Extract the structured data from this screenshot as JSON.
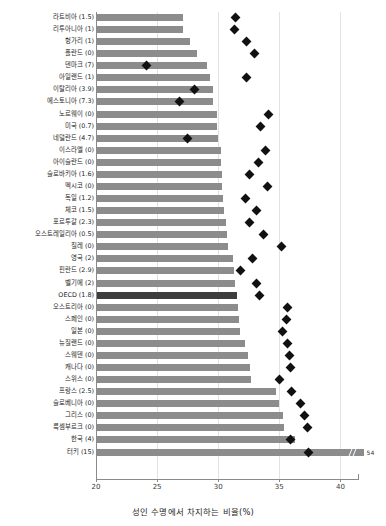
{
  "chart_data": {
    "type": "bar",
    "orientation": "horizontal",
    "title": "",
    "xlabel": "성인 수명에서 차지하는 비율(%)",
    "ylabel": "",
    "xlim": [
      20,
      42
    ],
    "xticks": [
      20,
      25,
      30,
      35,
      40
    ],
    "xticklabels": [
      "20",
      "25",
      "30",
      "35",
      "40"
    ],
    "grid": true,
    "grid_axis": "x",
    "legend": null,
    "bar_color": "#8c8c8c",
    "highlight_color": "#3d3d3d",
    "marker_color": "#111111",
    "marker_shape": "diamond",
    "axis_break": {
      "row": "터키 (15)",
      "display_value": "54",
      "true_value": 54
    },
    "categories": [
      "라트비아 (1.5)",
      "리투아니아 (1)",
      "헝가리 (1)",
      "폴란드 (0)",
      "덴마크 (7)",
      "아일랜드 (1)",
      "이탈리아 (3.9)",
      "에스토니아 (7.3)",
      "노르웨이 (0)",
      "미국 (0.7)",
      "네덜란드 (4.7)",
      "이스라엘 (0)",
      "아이슬란드 (0)",
      "슬로바키아 (1.6)",
      "멕시코 (0)",
      "독일 (1.2)",
      "체코 (1.5)",
      "포르투갈 (2.3)",
      "오스트레일리아 (0.5)",
      "칠레 (0)",
      "영국 (2)",
      "핀란드 (2.9)",
      "벨기에 (2)",
      "OECD (1.8)",
      "오스트리아 (0)",
      "스페인 (0)",
      "일본 (0)",
      "뉴질랜드 (0)",
      "스웨덴 (0)",
      "캐나다 (0)",
      "스위스 (0)",
      "프랑스 (2.5)",
      "슬로베니아 (0)",
      "그리스 (0)",
      "룩셈부르크 (0)",
      "한국 (4)",
      "터키 (15)"
    ],
    "values": [
      27.1,
      27.1,
      27.7,
      28.3,
      29.1,
      29.3,
      29.6,
      29.6,
      29.9,
      29.9,
      30.0,
      30.2,
      30.2,
      30.3,
      30.3,
      30.4,
      30.5,
      30.6,
      30.7,
      30.8,
      31.2,
      31.3,
      31.4,
      31.5,
      31.6,
      31.7,
      31.8,
      32.2,
      32.4,
      32.6,
      32.7,
      34.7,
      35.0,
      35.3,
      35.4,
      36.3,
      41.9
    ],
    "markers": [
      31.4,
      31.3,
      32.3,
      33.0,
      24.1,
      32.3,
      28.1,
      26.8,
      34.1,
      33.5,
      27.5,
      33.9,
      33.3,
      32.6,
      34.0,
      32.2,
      33.1,
      32.6,
      33.7,
      35.2,
      32.8,
      31.8,
      33.1,
      33.4,
      35.7,
      35.6,
      35.3,
      35.7,
      35.8,
      35.9,
      35.0,
      36.0,
      36.7,
      37.1,
      37.3,
      35.9,
      37.4
    ],
    "category_highlight_index": 23,
    "num_rows": 37
  }
}
